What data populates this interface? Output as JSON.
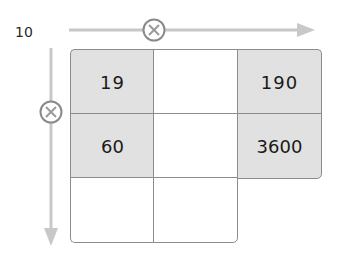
{
  "multiplier_label": "10",
  "colors": {
    "arrow": "#c8c8c8",
    "circle": "#8a8a8a",
    "grid_line": "#8c8c8c",
    "shaded_cell": "#e1e1e1",
    "text": "#1a1a1a"
  },
  "operators": {
    "horizontal": "multiply-circle-icon",
    "vertical": "multiply-circle-icon"
  },
  "grid": {
    "rows": [
      [
        "19",
        "",
        "190"
      ],
      [
        "60",
        "",
        "3600"
      ],
      [
        "",
        ""
      ]
    ]
  }
}
